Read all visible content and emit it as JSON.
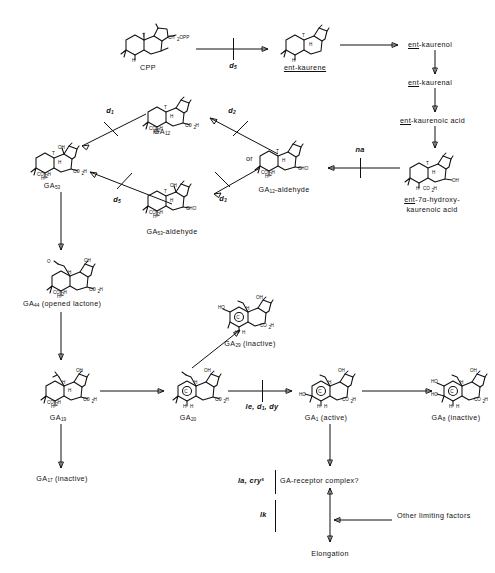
{
  "diagram": {
    "type": "biochemical-pathway"
  },
  "nodes": {
    "cpp": "CPP",
    "ent_kaurene": "ent-kaurene",
    "ent_kaurenol": "ent-kaurenol",
    "ent_kaurenal": "ent-kaurenal",
    "ent_kaurenoic_acid": "ent-kaurenoic acid",
    "ent_hydroxy_line1": "ent-7α-hydroxy-",
    "ent_hydroxy_line2": "kaurenoic acid",
    "ga12": "GA12",
    "ga53": "GA53",
    "ga12_aldehyde": "GA12-aldehyde",
    "ga53_aldehyde": "GA53-aldehyde",
    "ga44": "GA44 (opened lactone)",
    "ga19": "GA19",
    "ga20": "GA20",
    "ga1": "GA1 (active)",
    "ga8": "GA8 (inactive)",
    "ga29": "GA29 (inactive)",
    "ga17": "GA17 (inactive)",
    "receptor": "GA-receptor complex?",
    "elongation": "Elongation",
    "other_factors": "Other limiting factors"
  },
  "node_parts": {
    "ga12": {
      "base": "GA",
      "sub": "12"
    },
    "ga53": {
      "base": "GA",
      "sub": "53"
    },
    "ga12_aldehyde": {
      "base": "GA",
      "sub": "12",
      "tail": "-aldehyde"
    },
    "ga53_aldehyde": {
      "base": "GA",
      "sub": "53",
      "tail": "-aldehyde"
    },
    "ga44": {
      "base": "GA",
      "sub": "44",
      "tail": " (opened lactone)"
    },
    "ga19": {
      "base": "GA",
      "sub": "19"
    },
    "ga20": {
      "base": "GA",
      "sub": "20"
    },
    "ga1": {
      "base": "GA",
      "sub": "1",
      "tail": " (active)"
    },
    "ga8": {
      "base": "GA",
      "sub": "8",
      "tail": " (inactive)"
    },
    "ga29": {
      "base": "GA",
      "sub": "29",
      "tail": " (inactive)"
    },
    "ga17": {
      "base": "GA",
      "sub": "17",
      "tail": " (inactive)"
    }
  },
  "mutant_blocks": {
    "d5_kaurene": {
      "base": "d",
      "sub": "5"
    },
    "d1_ga12": {
      "base": "d",
      "sub": "1"
    },
    "d2_ga12": {
      "base": "d",
      "sub": "2"
    },
    "d5_ga53ald": {
      "base": "d",
      "sub": "5"
    },
    "d3_ga12ald": {
      "base": "d",
      "sub": "3"
    },
    "na": {
      "base": "na"
    },
    "le_d1_dy": {
      "base": "le, d",
      "sub": "1",
      "tail": ", dy"
    },
    "la_crys": {
      "base": "la, cry",
      "sup": "s"
    },
    "lk": {
      "base": "lk"
    }
  },
  "connector_labels": {
    "or": "or"
  },
  "formula_text": {
    "ch2opp": "CH2OPP",
    "co2h": "CO2H",
    "cho": "CHO",
    "oh": "OH",
    "ho": "HO",
    "h": "H",
    "o": "O"
  }
}
